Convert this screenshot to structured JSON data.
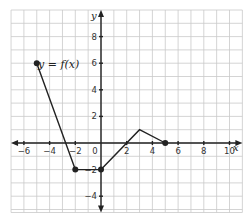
{
  "chart_data": {
    "type": "line",
    "title": "",
    "annotation": "y = f(x)",
    "xlabel": "x",
    "ylabel": "y",
    "xlim": [
      -7,
      11
    ],
    "ylim": [
      -5,
      10
    ],
    "grid": true,
    "x_ticks": [
      -6,
      -4,
      -2,
      0,
      2,
      4,
      6,
      8,
      10
    ],
    "y_ticks": [
      -4,
      -2,
      2,
      4,
      6,
      8
    ],
    "x_tick_labels": [
      "−6",
      "−4",
      "−2",
      "0",
      "2",
      "4",
      "6",
      "8",
      "10"
    ],
    "y_tick_labels": [
      "−4",
      "−2",
      "2",
      "4",
      "6",
      "8"
    ],
    "series": [
      {
        "name": "f(x)",
        "points": [
          [
            -5,
            6
          ],
          [
            -2,
            -2
          ],
          [
            0,
            -2
          ],
          [
            3,
            1
          ],
          [
            5,
            0
          ]
        ],
        "endpoint_markers": true,
        "color": "#222222"
      }
    ]
  },
  "labels": {
    "function": "y = f(x)",
    "x_axis": "x",
    "y_axis": "y"
  }
}
